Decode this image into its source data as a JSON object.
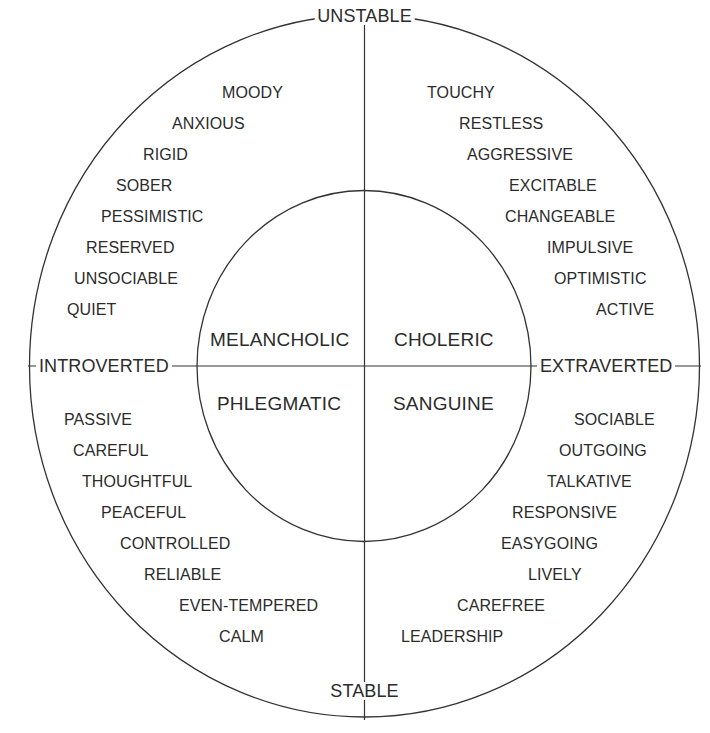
{
  "diagram": {
    "colors": {
      "background": "#ffffff",
      "stroke": "#333333",
      "text": "#2b2b2b"
    },
    "axes": {
      "top": "UNSTABLE",
      "bottom": "STABLE",
      "left": "INTROVERTED",
      "right": "EXTRAVERTED"
    },
    "temperaments": {
      "upper_left": "MELANCHOLIC",
      "upper_right": "CHOLERIC",
      "lower_left": "PHLEGMATIC",
      "lower_right": "SANGUINE"
    },
    "traits": {
      "unstable_introverted": [
        "MOODY",
        "ANXIOUS",
        "RIGID",
        "SOBER",
        "PESSIMISTIC",
        "RESERVED",
        "UNSOCIABLE",
        "QUIET"
      ],
      "unstable_extraverted": [
        "TOUCHY",
        "RESTLESS",
        "AGGRESSIVE",
        "EXCITABLE",
        "CHANGEABLE",
        "IMPULSIVE",
        "OPTIMISTIC",
        "ACTIVE"
      ],
      "stable_introverted": [
        "PASSIVE",
        "CAREFUL",
        "THOUGHTFUL",
        "PEACEFUL",
        "CONTROLLED",
        "RELIABLE",
        "EVEN-TEMPERED",
        "CALM"
      ],
      "stable_extraverted": [
        "SOCIABLE",
        "OUTGOING",
        "TALKATIVE",
        "RESPONSIVE",
        "EASYGOING",
        "LIVELY",
        "CAREFREE",
        "LEADERSHIP"
      ]
    }
  }
}
